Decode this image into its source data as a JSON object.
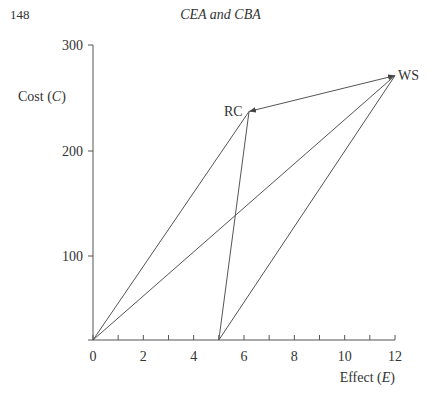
{
  "page": {
    "number": "148",
    "running_head": "CEA and CBA"
  },
  "chart_data": {
    "type": "line",
    "title": "",
    "xlabel": "Effect (E)",
    "ylabel": "Cost (C)",
    "xlabel_main": "Effect (",
    "xlabel_var": "E",
    "xlabel_close": ")",
    "ylabel_main": "Cost (",
    "ylabel_var": "C",
    "ylabel_close": ")",
    "xlim": [
      0,
      12
    ],
    "ylim": [
      20,
      300
    ],
    "x_ticks": [
      0,
      1,
      2,
      3,
      4,
      5,
      6,
      7,
      8,
      9,
      10,
      11,
      12
    ],
    "x_tick_labels": [
      "0",
      "2",
      "4",
      "6",
      "8",
      "10",
      "12"
    ],
    "x_tick_label_values": [
      0,
      2,
      4,
      6,
      8,
      10,
      12
    ],
    "y_tick_labels": [
      "100",
      "200",
      "300"
    ],
    "y_tick_label_values": [
      100,
      200,
      300
    ],
    "grid": false,
    "points": [
      {
        "label": "RC",
        "x": 6.2,
        "y": 237
      },
      {
        "label": "WS",
        "x": 12,
        "y": 271
      }
    ],
    "origins": [
      {
        "label": "",
        "x": 0,
        "y": 20
      },
      {
        "label": "",
        "x": 5,
        "y": 20
      }
    ],
    "segments": [
      {
        "from": [
          0,
          20
        ],
        "to": [
          6.2,
          237
        ],
        "arrow": "none"
      },
      {
        "from": [
          0,
          20
        ],
        "to": [
          12,
          271
        ],
        "arrow": "none"
      },
      {
        "from": [
          5,
          20
        ],
        "to": [
          6.2,
          237
        ],
        "arrow": "none"
      },
      {
        "from": [
          5,
          20
        ],
        "to": [
          12,
          271
        ],
        "arrow": "none"
      },
      {
        "from": [
          6.2,
          237
        ],
        "to": [
          12,
          271
        ],
        "arrow": "both"
      }
    ]
  }
}
